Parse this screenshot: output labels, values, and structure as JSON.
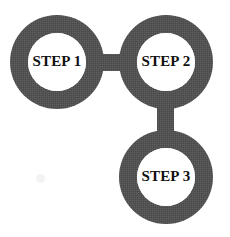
{
  "diagram": {
    "background_color": "#ffffff",
    "node_fill_color": "#555555",
    "node_hole_color": "#ffffff",
    "label_color": "#111111",
    "nodes": [
      {
        "id": "step-1",
        "label": "STEP 1",
        "cx": 57,
        "cy": 62,
        "outer_r": 47,
        "inner_r": 29
      },
      {
        "id": "step-2",
        "label": "STEP 2",
        "cx": 166,
        "cy": 62,
        "outer_r": 47,
        "inner_r": 29
      },
      {
        "id": "step-3",
        "label": "STEP 3",
        "cx": 166,
        "cy": 177,
        "outer_r": 47,
        "inner_r": 29
      }
    ],
    "connectors": [
      {
        "id": "connector-step1-step2",
        "orientation": "horizontal",
        "from": "step-1",
        "to": "step-2",
        "x": 96,
        "y": 54,
        "width": 32,
        "height": 17
      },
      {
        "id": "connector-step2-step3",
        "orientation": "vertical",
        "from": "step-2",
        "to": "step-3",
        "x": 157,
        "y": 101,
        "width": 17,
        "height": 32
      }
    ],
    "artifacts": [
      {
        "id": "scan-speck",
        "x": 36,
        "y": 174
      }
    ]
  }
}
